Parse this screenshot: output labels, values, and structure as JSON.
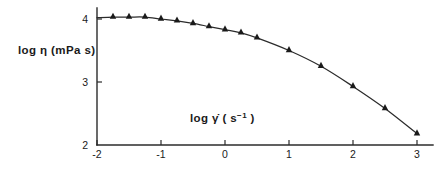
{
  "chart_data": {
    "type": "line",
    "title": "",
    "subtitle": "",
    "xlabel": "log γ̇ ( s⁻¹ )",
    "ylabel": "log η (mPa s)",
    "xlim": [
      -2,
      3
    ],
    "ylim": [
      2,
      4
    ],
    "xticks": [
      -2,
      -1,
      0,
      1,
      2,
      3
    ],
    "xticklabels": [
      "-2",
      "-1",
      "0",
      "1",
      "2",
      "3"
    ],
    "yticks": [
      2,
      3,
      4
    ],
    "yticklabels": [
      "2",
      "3",
      "4"
    ],
    "grid": false,
    "legend": null,
    "marker": "triangle-up",
    "series": [
      {
        "name": "viscosity",
        "x": [
          -1.75,
          -1.5,
          -1.25,
          -1.0,
          -0.75,
          -0.5,
          -0.25,
          0.0,
          0.25,
          0.5,
          1.0,
          1.5,
          2.0,
          2.5,
          3.0
        ],
        "y": [
          4.03,
          4.03,
          4.03,
          4.0,
          3.97,
          3.93,
          3.88,
          3.83,
          3.78,
          3.7,
          3.5,
          3.25,
          2.93,
          2.58,
          2.18
        ]
      }
    ],
    "annotations": []
  },
  "axis": {
    "ylabel_text": "log η (mPa s)",
    "xlabel_prefix": "log γ̇ ( s",
    "xlabel_exponent": "−1",
    "xlabel_suffix": " )"
  }
}
